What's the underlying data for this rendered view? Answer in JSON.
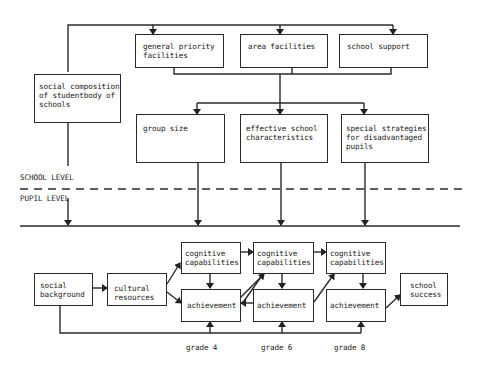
{
  "diagram": {
    "school_level_label": "SCHOOL LEVEL",
    "pupil_level_label": "PUPIL LEVEL",
    "boxes": {
      "general_priority": "general priority\nfacilities",
      "area_facilities": "area facilities",
      "school_support": "school support",
      "social_composition": "social composition\nof studentbody of\nschools",
      "group_size": "group size",
      "effective_school": "effective school\ncharacteristics",
      "special_strategies": "special strategies\nfor disadvantaged\npupils",
      "social_background": "social\nbackground",
      "cultural_resources": "cultural\nresources",
      "cog_g4": "cognitive\ncapabilities",
      "ach_g4": "achievement",
      "cog_g6": "cognitive\ncapabilities",
      "ach_g6": "achievement",
      "cog_g8": "cognitive\ncapabilities",
      "ach_g8": "achievement",
      "school_success": "school\nsuccess"
    },
    "grades": [
      "grade 4",
      "grade 6",
      "grade 8"
    ]
  }
}
